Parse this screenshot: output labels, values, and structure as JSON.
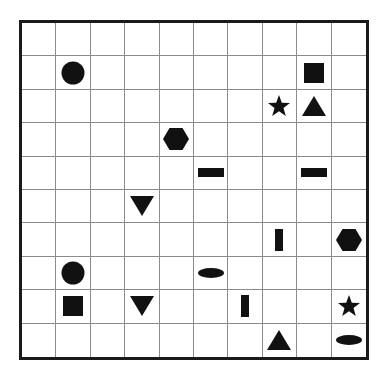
{
  "board": {
    "columns": 10,
    "rows": 10,
    "colors": {
      "piece": "#111111",
      "grid_line": "#8a8a8a",
      "border": "#1a1a1a",
      "background": "#ffffff"
    },
    "pieces": [
      {
        "row": 1,
        "col": 1,
        "shape": "circle"
      },
      {
        "row": 1,
        "col": 8,
        "shape": "square"
      },
      {
        "row": 2,
        "col": 7,
        "shape": "star"
      },
      {
        "row": 2,
        "col": 8,
        "shape": "triangle-up"
      },
      {
        "row": 3,
        "col": 4,
        "shape": "hexagon"
      },
      {
        "row": 4,
        "col": 5,
        "shape": "bar-horizontal"
      },
      {
        "row": 4,
        "col": 8,
        "shape": "bar-horizontal"
      },
      {
        "row": 5,
        "col": 3,
        "shape": "triangle-down"
      },
      {
        "row": 6,
        "col": 7,
        "shape": "bar-vertical"
      },
      {
        "row": 6,
        "col": 9,
        "shape": "hexagon"
      },
      {
        "row": 7,
        "col": 1,
        "shape": "circle"
      },
      {
        "row": 7,
        "col": 5,
        "shape": "ellipse"
      },
      {
        "row": 8,
        "col": 1,
        "shape": "square"
      },
      {
        "row": 8,
        "col": 3,
        "shape": "triangle-down"
      },
      {
        "row": 8,
        "col": 6,
        "shape": "bar-vertical"
      },
      {
        "row": 8,
        "col": 9,
        "shape": "star"
      },
      {
        "row": 9,
        "col": 7,
        "shape": "triangle-up"
      },
      {
        "row": 9,
        "col": 9,
        "shape": "ellipse"
      }
    ]
  }
}
